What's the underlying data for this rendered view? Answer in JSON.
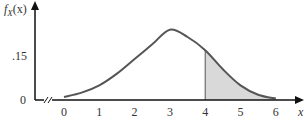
{
  "chart_data": {
    "type": "area",
    "title": "",
    "xlabel": "x",
    "ylabel": "f_X(x)",
    "ylabel_main": "f",
    "ylabel_sub": "X",
    "ylabel_arg": "(x)",
    "x_ticks": [
      "0",
      "1",
      "2",
      "3",
      "4",
      "5",
      "6"
    ],
    "y_ticks": [
      "0",
      ".15"
    ],
    "xlim": [
      0,
      6
    ],
    "ylim": [
      0,
      0.25
    ],
    "x": [
      0,
      0.5,
      1,
      1.5,
      2,
      2.5,
      3,
      3.5,
      4,
      4.5,
      5,
      5.5,
      6
    ],
    "values": [
      0.01,
      0.025,
      0.05,
      0.09,
      0.14,
      0.19,
      0.24,
      0.215,
      0.17,
      0.105,
      0.05,
      0.018,
      0.005
    ],
    "shaded_region": {
      "from": 4,
      "to": 6,
      "color": "#d9d9d9"
    },
    "axis_break": true,
    "grid": false,
    "legend": "none",
    "curve_color": "#555555"
  }
}
